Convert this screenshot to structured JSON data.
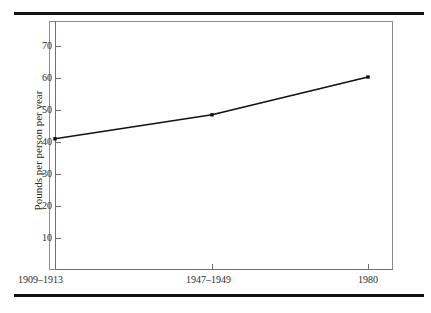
{
  "chart_data": {
    "type": "line",
    "title": "",
    "xlabel": "",
    "ylabel": "Pounds per person per year",
    "categories": [
      "1909–1913",
      "1947–1949",
      "1980"
    ],
    "values": [
      41.0,
      48.5,
      60.3
    ],
    "series": [
      {
        "name": "Pounds per person per year",
        "values": [
          41.0,
          48.5,
          60.3
        ]
      }
    ],
    "ylim": [
      0,
      75
    ],
    "yticks": [
      10,
      20,
      30,
      40,
      50,
      60,
      70
    ],
    "ytick_labels": [
      "10",
      "20",
      "30",
      "40",
      "50",
      "60",
      "70"
    ],
    "xtick_labels": [
      "1909–1913",
      "1947–1949",
      "1980"
    ],
    "grid": false,
    "legend": false,
    "legend_position": "none",
    "marker": "square",
    "line_color": "#111111",
    "frame_color": "#8d8d8d",
    "rule_color": "#111111"
  }
}
